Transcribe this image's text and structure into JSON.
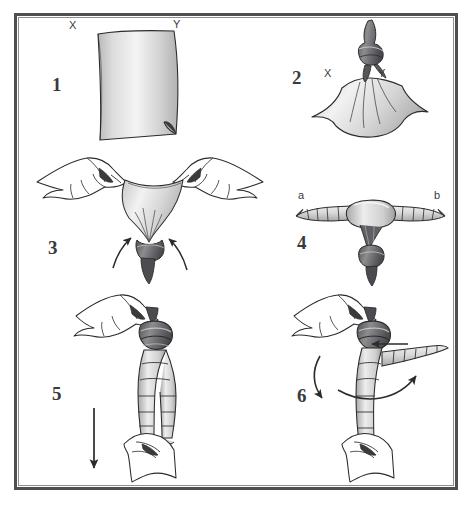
{
  "document": {
    "type": "instructional-diagram",
    "title": "Knotted cloth tying instructions",
    "background_color": "#ffffff",
    "frame_color": "#4f4f52",
    "line_color": "#2b2b2d",
    "cloth_light": "#f2f2f2",
    "cloth_mid": "#cfcfcf",
    "cloth_dark": "#9a9a9a",
    "knot_dark": "#5b5b5e",
    "knot_mid": "#7d7d80",
    "skin_fill": "#ffffff"
  },
  "panels": [
    {
      "id": "panel-1",
      "number": "1",
      "caption_labels": [
        {
          "text": "X",
          "name": "corner-label-x"
        },
        {
          "text": "Y",
          "name": "corner-label-y"
        }
      ],
      "description": "Flat square cloth laid out with corners X and Y at the top and a folded corner at lower right"
    },
    {
      "id": "panel-2",
      "number": "2",
      "caption_labels": [
        {
          "text": "X",
          "name": "corner-label-x"
        },
        {
          "text": "Y",
          "name": "corner-label-y"
        }
      ],
      "description": "Corners X and Y knotted together at the top of the hanging cloth"
    },
    {
      "id": "panel-3",
      "number": "3",
      "caption_labels": [],
      "description": "Two hands gripping the cloth edges and pulling outward while the knotted tail hangs below; two curved arrows point up and outward"
    },
    {
      "id": "panel-4",
      "number": "4",
      "caption_labels": [
        {
          "text": "a",
          "name": "end-label-a"
        },
        {
          "text": "b",
          "name": "end-label-b"
        }
      ],
      "description": "Rolled cloth forming a horizontal bar with ends a and b and the knot hanging below the centre"
    },
    {
      "id": "panel-5",
      "number": "5",
      "caption_labels": [],
      "description": "Both hands holding the rolled cloth vertically, top hand at the knot, lower hand below; a straight arrow points downward"
    },
    {
      "id": "panel-6",
      "number": "6",
      "caption_labels": [],
      "description": "Rolled cloth held vertically with one rolled end projecting sideways; arrows show it being swung across and around"
    }
  ],
  "arrows": [
    {
      "name": "arrow-panel3-left",
      "panel": "panel-3",
      "style": "curved",
      "direction": "up-left"
    },
    {
      "name": "arrow-panel3-right",
      "panel": "panel-3",
      "style": "curved",
      "direction": "up-right"
    },
    {
      "name": "arrow-panel5-down",
      "panel": "panel-5",
      "style": "straight",
      "direction": "down"
    },
    {
      "name": "arrow-panel6-left",
      "panel": "panel-6",
      "style": "straight",
      "direction": "left"
    },
    {
      "name": "arrow-panel6-curve-down",
      "panel": "panel-6",
      "style": "curved",
      "direction": "down-left"
    },
    {
      "name": "arrow-panel6-curve-right",
      "panel": "panel-6",
      "style": "curved",
      "direction": "right"
    }
  ]
}
